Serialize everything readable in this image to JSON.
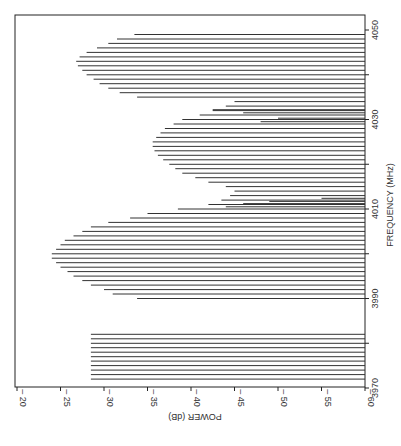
{
  "chart_data": {
    "type": "bar",
    "orientation": "rotated-90",
    "title": "",
    "xlabel": "FREQUENCY (MHz)",
    "ylabel": "POWER (dB)",
    "xlim": [
      3970,
      4050
    ],
    "ylim": [
      -60,
      -20
    ],
    "xticks": [
      3970,
      3990,
      4010,
      4030,
      4050
    ],
    "xticks_minor": [
      3980,
      4000,
      4020,
      4040
    ],
    "yticks": [
      -20,
      -25,
      -30,
      -35,
      -40,
      -45,
      -50,
      -55,
      -60
    ],
    "grid": false,
    "series": [
      {
        "name": "spectral lines",
        "x": [
          3972,
          3973,
          3974,
          3975,
          3976,
          3977,
          3978,
          3979,
          3980,
          3981,
          3982,
          3990,
          3991,
          3992,
          3993,
          3994,
          3995,
          3996,
          3997,
          3998,
          3999,
          4000,
          4001,
          4002,
          4003,
          4004,
          4005,
          4006,
          4007,
          4008,
          4009,
          4010,
          4011,
          4012,
          4013,
          4014,
          4010.5,
          4011.2,
          4011.7,
          4012.4,
          4015,
          4016,
          4017,
          4018,
          4019,
          4020,
          4021,
          4022,
          4023,
          4024,
          4025,
          4026,
          4027,
          4028,
          4029,
          4030,
          4031,
          4032,
          4033,
          4034,
          4029.5,
          4030.3,
          4031.5,
          4032.2,
          4035,
          4036,
          4037,
          4038,
          4039,
          4040,
          4041,
          4042,
          4043,
          4044,
          4045,
          4046,
          4047,
          4048,
          4049
        ],
        "values": [
          -28.5,
          -28.5,
          -28.5,
          -28.5,
          -28.5,
          -28.5,
          -28.5,
          -28.5,
          -28.5,
          -28.5,
          -28.5,
          -33.8,
          -31,
          -30,
          -28.5,
          -27.5,
          -26.5,
          -25.8,
          -25,
          -24.5,
          -24,
          -24,
          -24.5,
          -25,
          -25.5,
          -26.5,
          -27.5,
          -28.5,
          -30.5,
          -33,
          -35,
          -38.5,
          -42,
          -43.5,
          -44.5,
          -45,
          -44,
          -46,
          -49,
          -55,
          -44,
          -42,
          -40.5,
          -39,
          -38.2,
          -37.5,
          -36.8,
          -36.2,
          -35.8,
          -35.6,
          -35.6,
          -36,
          -36.5,
          -37,
          -38,
          -39,
          -41,
          -42.5,
          -44,
          -45,
          -48,
          -50,
          -46,
          -42.5,
          -33.8,
          -31.8,
          -30.5,
          -29.5,
          -28.8,
          -28,
          -27.5,
          -27,
          -26.8,
          -27.2,
          -28,
          -29.2,
          -30.5,
          -31.5,
          -33.5
        ]
      }
    ]
  },
  "axes": {
    "x_axis_title": "FREQUENCY (MHz)",
    "y_axis_title": "POWER (dB)",
    "freq_tick_labels": [
      "3970",
      "3990",
      "4010",
      "4030",
      "4050"
    ],
    "power_tick_labels": [
      "-20",
      "-25",
      "-30",
      "-35",
      "-40",
      "-45",
      "-50",
      "-55",
      "-60"
    ]
  }
}
